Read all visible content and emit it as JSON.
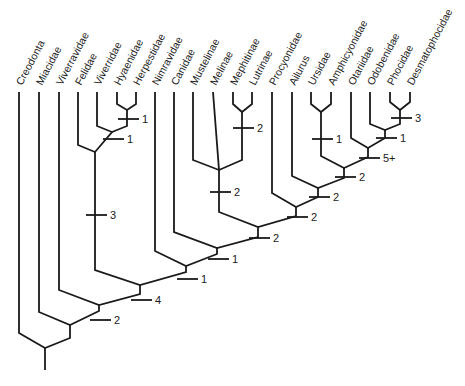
{
  "diagram": {
    "type": "cladogram",
    "taxa": [
      {
        "name": "Creodonta",
        "x": 19
      },
      {
        "name": "Miacidae",
        "x": 39
      },
      {
        "name": "Viverravidae",
        "x": 59
      },
      {
        "name": "Felidae",
        "x": 78
      },
      {
        "name": "Viverridae",
        "x": 97
      },
      {
        "name": "Hyaenidae",
        "x": 117
      },
      {
        "name": "Herpestidae",
        "x": 136
      },
      {
        "name": "Nimravidae",
        "x": 155
      },
      {
        "name": "Canidae",
        "x": 174
      },
      {
        "name": "Mustelinae",
        "x": 193
      },
      {
        "name": "Melinae",
        "x": 213
      },
      {
        "name": "Mephitinae",
        "x": 233
      },
      {
        "name": "Lutrinae",
        "x": 252
      },
      {
        "name": "Procyonidae",
        "x": 272
      },
      {
        "name": "Ailurus",
        "x": 292
      },
      {
        "name": "Ursidae",
        "x": 311
      },
      {
        "name": "Amphicyonidae",
        "x": 331
      },
      {
        "name": "Otariidae",
        "x": 351
      },
      {
        "name": "Odobenidae",
        "x": 370
      },
      {
        "name": "Phocidae",
        "x": 390
      },
      {
        "name": "Desmatophocidae",
        "x": 410
      }
    ],
    "character_ticks": [
      {
        "label": "1",
        "x": 127,
        "y": 119,
        "clade": "Hyaenidae+Herpestidae"
      },
      {
        "label": "1",
        "x": 112,
        "y": 139,
        "clade": "Viverridae+Hyaenidae+Herpestidae"
      },
      {
        "label": "3",
        "x": 95,
        "y": 215,
        "clade": "Feloidea"
      },
      {
        "label": "2",
        "x": 242,
        "y": 128,
        "clade": "Mephitinae+Lutrinae"
      },
      {
        "label": "2",
        "x": 219,
        "y": 192,
        "clade": "Mustelidae"
      },
      {
        "label": "1",
        "x": 321,
        "y": 139,
        "clade": "Ursidae+Amphicyonidae"
      },
      {
        "label": "3",
        "x": 400,
        "y": 118,
        "clade": "Phocidae+Desmatophocidae"
      },
      {
        "label": "1",
        "x": 385,
        "y": 138,
        "clade": "Odobenidae+Phocids"
      },
      {
        "label": "5+",
        "x": 368,
        "y": 158,
        "clade": "Pinnipedia"
      },
      {
        "label": "2",
        "x": 344,
        "y": 177,
        "clade": "Ursoidea+Pinnipedia"
      },
      {
        "label": "2",
        "x": 318,
        "y": 197,
        "clade": "Ailurus+"
      },
      {
        "label": "2",
        "x": 296,
        "y": 217,
        "clade": "Procyonidae+"
      },
      {
        "label": "2",
        "x": 258,
        "y": 238,
        "clade": "Musteloidea+"
      },
      {
        "label": "1",
        "x": 217,
        "y": 259,
        "clade": "Canidae+"
      },
      {
        "label": "1",
        "x": 186,
        "y": 279,
        "clade": "Nimravidae+Canoidea"
      },
      {
        "label": "4",
        "x": 140,
        "y": 300,
        "clade": "Carnivora crown"
      },
      {
        "label": "2",
        "x": 99,
        "y": 320,
        "clade": "Viverravidae+"
      }
    ]
  }
}
